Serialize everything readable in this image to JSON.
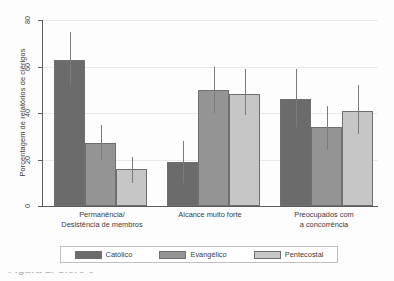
{
  "chart_data": {
    "type": "bar",
    "title": "",
    "subtitle": "",
    "xlabel": "",
    "ylabel": "Porcentagem de relatórios de clérigos",
    "ylim": [
      0,
      80
    ],
    "yticks": [
      0,
      20,
      40,
      60,
      80
    ],
    "ytick_labels": [
      "0",
      "20",
      "40",
      "60",
      "80"
    ],
    "grid": true,
    "grid_axis": "y",
    "legend_position": "bottom",
    "error_bars": true,
    "categories": [
      "Permanência/\nDesistência de membros",
      "Alcance muito forte",
      "Preocupados com\na concorrência"
    ],
    "category_lines": [
      [
        "Permanência/",
        "Desistência de membros"
      ],
      [
        "Alcance muito forte",
        ""
      ],
      [
        "Preocupados com",
        "a concorrência"
      ]
    ],
    "series": [
      {
        "name": "Católico",
        "color": "#6b6b6b",
        "values": [
          63,
          19,
          46
        ],
        "err_low": [
          52,
          10,
          34
        ],
        "err_high": [
          75,
          28,
          59
        ]
      },
      {
        "name": "Evangélico",
        "color": "#949494",
        "values": [
          27,
          50,
          34
        ],
        "err_low": [
          20,
          40,
          24
        ],
        "err_high": [
          35,
          60,
          43
        ]
      },
      {
        "name": "Pentecostal",
        "color": "#c6c6c6",
        "values": [
          16,
          48,
          41
        ],
        "err_low": [
          10,
          39,
          31
        ],
        "err_high": [
          21,
          59,
          52
        ]
      }
    ]
  },
  "axis": {
    "y_title": "Porcentagem de relatórios de clérigos",
    "tick_80": "80",
    "tick_60": "60",
    "tick_40": "40",
    "tick_20": "20",
    "tick_0": "0"
  },
  "categories": {
    "g1_line1": "Permanência/",
    "g1_line2": "Desistência de membros",
    "g2_line1": "Alcance muito forte",
    "g3_line1": "Preocupados com",
    "g3_line2": "a concorrência"
  },
  "legend": {
    "item1": "Católico",
    "item2": "Evangélico",
    "item3": "Pentecostal"
  },
  "caption": {
    "partial_text": "Figura 1. Clero e"
  }
}
